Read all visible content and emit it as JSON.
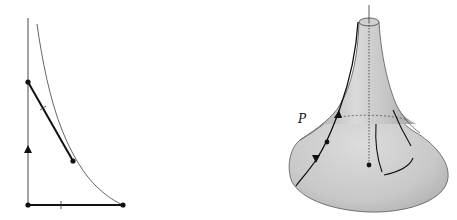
{
  "figure": {
    "left_panel": {
      "description": "Tractrix curve with tangent segment of constant length",
      "colors": {
        "curve": "#555555",
        "segment": "#111111",
        "axis": "#333333"
      }
    },
    "right_panel": {
      "description": "Pseudosphere surface with geodesic through point P",
      "label_p": "P",
      "colors": {
        "surface_light": "#e4e4e4",
        "surface_dark": "#a8a8a8",
        "outline": "#444444",
        "curve": "#111111"
      }
    }
  }
}
